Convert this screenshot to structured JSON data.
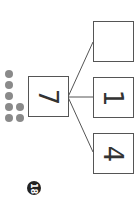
{
  "worksheet": {
    "page_number": "18",
    "number_bond": {
      "whole": "7",
      "parts": [
        "",
        "1",
        "4"
      ]
    },
    "counters": {
      "count": 7,
      "color": "#8a8a8a"
    }
  }
}
